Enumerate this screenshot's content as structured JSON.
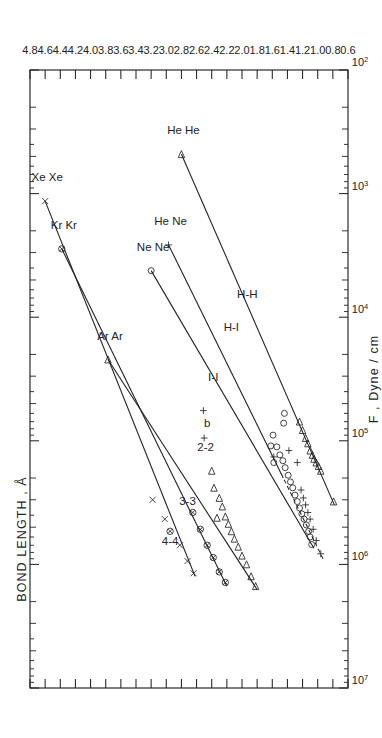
{
  "figure": {
    "orientation": "rotated-90-ccw",
    "background": "#ffffff",
    "ink": "#232323"
  },
  "chart_data": {
    "type": "scatter",
    "title": "",
    "xlabel": "F , Dyne / cm",
    "ylabel": "BOND LENGTH , Å",
    "x_scale": "log",
    "y_scale": "linear",
    "xlim": [
      100,
      10000000
    ],
    "ylim": [
      0.6,
      4.8
    ],
    "grid": false,
    "legend": "none",
    "x_decade_labels": [
      "10⁷",
      "10⁶",
      "10⁵",
      "10⁴",
      "10³",
      "10²"
    ],
    "x_decade_values": [
      10000000,
      1000000,
      100000,
      10000,
      1000,
      100
    ],
    "y_tick_labels": [
      "0.6",
      "0.8",
      "1.0",
      "1.2",
      "1.4",
      "1.6",
      "1.8",
      "2.0",
      "2.2",
      "2.4",
      "2.6",
      "2.8",
      "3.0",
      "3.2",
      "3.4",
      "3.6",
      "3.8",
      "4.0",
      "4.2",
      "4.4",
      "4.6",
      "4.8"
    ],
    "y_tick_values": [
      0.6,
      0.8,
      1.0,
      1.2,
      1.4,
      1.6,
      1.8,
      2.0,
      2.2,
      2.4,
      2.6,
      2.8,
      3.0,
      3.2,
      3.4,
      3.6,
      3.8,
      4.0,
      4.2,
      4.4,
      4.6,
      4.8
    ],
    "series": [
      {
        "name": "4-4",
        "label": "4-4",
        "label_at": {
          "F": 700000,
          "r": 2.95
        },
        "marker": "x-and-crossed-circle",
        "line_fit": {
          "from": {
            "F": 1250000,
            "r": 2.62
          },
          "to": {
            "F": 1150,
            "r": 4.6
          }
        },
        "endpoint_label": "Xe Xe",
        "points": [
          {
            "F": 1180000,
            "r": 2.64,
            "marker": "x"
          },
          {
            "F": 940000,
            "r": 2.72,
            "marker": "x"
          },
          {
            "F": 700000,
            "r": 2.82,
            "marker": "x"
          },
          {
            "F": 540000,
            "r": 2.95,
            "marker": "crossed-circle"
          },
          {
            "F": 430000,
            "r": 3.02,
            "marker": "x"
          },
          {
            "F": 300000,
            "r": 3.18,
            "marker": "x"
          },
          {
            "F": 1150,
            "r": 4.6,
            "marker": "x"
          }
        ]
      },
      {
        "name": "3-3",
        "label": "3-3",
        "label_at": {
          "F": 330000,
          "r": 2.72
        },
        "marker": "crossed-circle",
        "line_fit": {
          "from": {
            "F": 1500000,
            "r": 2.2
          },
          "to": {
            "F": 2800,
            "r": 4.38
          }
        },
        "endpoint_label": "Kr Kr",
        "points": [
          {
            "F": 1400000,
            "r": 2.22,
            "marker": "crossed-circle"
          },
          {
            "F": 1150000,
            "r": 2.3,
            "marker": "crossed-circle"
          },
          {
            "F": 880000,
            "r": 2.38,
            "marker": "crossed-circle"
          },
          {
            "F": 700000,
            "r": 2.46,
            "marker": "crossed-circle"
          },
          {
            "F": 520000,
            "r": 2.55,
            "marker": "crossed-circle"
          },
          {
            "F": 380000,
            "r": 2.65,
            "marker": "crossed-circle"
          },
          {
            "F": 2800,
            "r": 4.38,
            "marker": "crossed-circle"
          }
        ]
      },
      {
        "name": "2-2",
        "label": "2-2",
        "label_at": {
          "F": 120000,
          "r": 2.48
        },
        "marker": "triangle",
        "line_fit": {
          "from": {
            "F": 1600000,
            "r": 1.8
          },
          "to": {
            "F": 22000,
            "r": 3.77
          }
        },
        "endpoint_label": "Ar Ar",
        "points": [
          {
            "F": 1500000,
            "r": 1.82,
            "marker": "triangle"
          },
          {
            "F": 1250000,
            "r": 1.88,
            "marker": "triangle"
          },
          {
            "F": 1000000,
            "r": 1.94,
            "marker": "triangle"
          },
          {
            "F": 850000,
            "r": 2.0,
            "marker": "triangle"
          },
          {
            "F": 720000,
            "r": 2.05,
            "marker": "triangle"
          },
          {
            "F": 620000,
            "r": 2.1,
            "marker": "triangle"
          },
          {
            "F": 540000,
            "r": 2.14,
            "marker": "triangle"
          },
          {
            "F": 470000,
            "r": 2.18,
            "marker": "triangle"
          },
          {
            "F": 410000,
            "r": 2.22,
            "marker": "triangle"
          },
          {
            "F": 340000,
            "r": 2.26,
            "marker": "triangle"
          },
          {
            "F": 290000,
            "r": 2.3,
            "marker": "triangle"
          },
          {
            "F": 420000,
            "r": 2.33,
            "marker": "triangle"
          },
          {
            "F": 240000,
            "r": 2.37,
            "marker": "triangle"
          },
          {
            "F": 175000,
            "r": 2.4,
            "marker": "triangle"
          },
          {
            "F": 22000,
            "r": 3.77,
            "marker": "triangle"
          }
        ]
      },
      {
        "name": "I-I",
        "label": "I-I",
        "label_at": {
          "F": 33000,
          "r": 2.38
        },
        "marker": "circle",
        "line_fit": {
          "from": {
            "F": 740000,
            "r": 1.05
          },
          "to": {
            "F": 4200,
            "r": 3.2
          }
        },
        "endpoint_label": "Ne Ne",
        "points": [
          {
            "F": 690000,
            "r": 1.08,
            "marker": "circle"
          },
          {
            "F": 600000,
            "r": 1.1,
            "marker": "circle"
          },
          {
            "F": 540000,
            "r": 1.12,
            "marker": "circle"
          },
          {
            "F": 480000,
            "r": 1.15,
            "marker": "circle"
          },
          {
            "F": 430000,
            "r": 1.18,
            "marker": "circle"
          },
          {
            "F": 390000,
            "r": 1.21,
            "marker": "circle"
          },
          {
            "F": 350000,
            "r": 1.24,
            "marker": "circle"
          },
          {
            "F": 310000,
            "r": 1.27,
            "marker": "circle"
          },
          {
            "F": 275000,
            "r": 1.3,
            "marker": "circle"
          },
          {
            "F": 240000,
            "r": 1.33,
            "marker": "circle"
          },
          {
            "F": 215000,
            "r": 1.36,
            "marker": "circle"
          },
          {
            "F": 190000,
            "r": 1.39,
            "marker": "circle"
          },
          {
            "F": 165000,
            "r": 1.43,
            "marker": "circle"
          },
          {
            "F": 145000,
            "r": 1.46,
            "marker": "circle"
          },
          {
            "F": 130000,
            "r": 1.5,
            "marker": "circle"
          },
          {
            "F": 112000,
            "r": 1.54,
            "marker": "circle"
          },
          {
            "F": 150000,
            "r": 1.58,
            "marker": "circle"
          },
          {
            "F": 110000,
            "r": 1.62,
            "marker": "circle"
          },
          {
            "F": 90000,
            "r": 1.59,
            "marker": "circle"
          },
          {
            "F": 72000,
            "r": 1.45,
            "marker": "circle"
          },
          {
            "F": 4200,
            "r": 3.2,
            "marker": "circle"
          }
        ]
      },
      {
        "name": "H-I",
        "label": "H-I",
        "label_at": {
          "F": 13000,
          "r": 2.14
        },
        "marker": "plus",
        "line_fit": {
          "from": {
            "F": 900000,
            "r": 0.93
          },
          "to": {
            "F": 2600,
            "r": 2.97
          }
        },
        "line_style": "dashed-left-solid-right",
        "endpoint_label": "He Ne",
        "points": [
          {
            "F": 820000,
            "r": 0.96,
            "marker": "plus"
          },
          {
            "F": 640000,
            "r": 1.02,
            "marker": "plus"
          },
          {
            "F": 520000,
            "r": 1.06,
            "marker": "plus"
          },
          {
            "F": 430000,
            "r": 1.1,
            "marker": "plus"
          },
          {
            "F": 380000,
            "r": 1.13,
            "marker": "plus"
          },
          {
            "F": 330000,
            "r": 1.16,
            "marker": "plus"
          },
          {
            "F": 290000,
            "r": 1.19,
            "marker": "plus"
          },
          {
            "F": 250000,
            "r": 1.22,
            "marker": "plus"
          },
          {
            "F": 150000,
            "r": 1.27,
            "marker": "plus"
          },
          {
            "F": 135000,
            "r": 1.58,
            "marker": "plus"
          },
          {
            "F": 120000,
            "r": 1.38,
            "marker": "plus"
          },
          {
            "F": 57000,
            "r": 2.51,
            "marker": "plus"
          },
          {
            "F": 2600,
            "r": 2.97,
            "marker": "plus"
          }
        ]
      },
      {
        "name": "H-H",
        "label": "H-H",
        "label_at": {
          "F": 7000,
          "r": 1.93
        },
        "marker": "triangle",
        "line_fit": {
          "from": {
            "F": 330000,
            "r": 0.78
          },
          "to": {
            "F": 480,
            "r": 2.8
          }
        },
        "endpoint_label": "He He",
        "points": [
          {
            "F": 310000,
            "r": 0.79,
            "marker": "triangle"
          },
          {
            "F": 175000,
            "r": 0.96,
            "marker": "triangle"
          },
          {
            "F": 160000,
            "r": 0.99,
            "marker": "triangle"
          },
          {
            "F": 150000,
            "r": 1.02,
            "marker": "triangle"
          },
          {
            "F": 140000,
            "r": 1.05,
            "marker": "triangle"
          },
          {
            "F": 130000,
            "r": 1.07,
            "marker": "triangle"
          },
          {
            "F": 120000,
            "r": 1.1,
            "marker": "triangle"
          },
          {
            "F": 105000,
            "r": 1.13,
            "marker": "triangle"
          },
          {
            "F": 95000,
            "r": 1.16,
            "marker": "triangle"
          },
          {
            "F": 82000,
            "r": 1.2,
            "marker": "triangle"
          },
          {
            "F": 70000,
            "r": 1.24,
            "marker": "triangle"
          },
          {
            "F": 60000,
            "r": 1.44,
            "marker": "circle"
          },
          {
            "F": 480,
            "r": 2.8,
            "marker": "triangle"
          }
        ]
      }
    ],
    "annotations": [
      {
        "text": "b",
        "F": 95000,
        "r": 2.5,
        "marker": "plus"
      },
      {
        "text": "Xe Xe",
        "F": 1150,
        "r": 4.6
      },
      {
        "text": "Kr Kr",
        "F": 2800,
        "r": 4.38
      },
      {
        "text": "Ar Ar",
        "F": 22000,
        "r": 3.77
      },
      {
        "text": "Ne Ne",
        "F": 4200,
        "r": 3.2
      },
      {
        "text": "He Ne",
        "F": 2600,
        "r": 2.97
      },
      {
        "text": "He He",
        "F": 480,
        "r": 2.8
      }
    ]
  },
  "axes": {
    "x_axis_title": "F , Dyne / cm",
    "y_axis_title": "BOND LENGTH , Å"
  },
  "series_labels": {
    "s44": "4-4",
    "s33": "3-3",
    "s22": "2-2",
    "sII": "I-I",
    "sHI": "H-I",
    "sHH": "H-H",
    "b": "b"
  },
  "endpoint_labels": {
    "xexe": "Xe Xe",
    "krkr": "Kr Kr",
    "arar": "Ar Ar",
    "nene": "Ne Ne",
    "hene": "He Ne",
    "hehe": "He He"
  },
  "decade_labels": {
    "d7": "10",
    "d7s": "7",
    "d6": "10",
    "d6s": "6",
    "d5": "10",
    "d5s": "5",
    "d4": "10",
    "d4s": "4",
    "d3": "10",
    "d3s": "3",
    "d2": "10",
    "d2s": "2"
  }
}
